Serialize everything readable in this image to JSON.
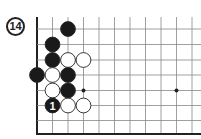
{
  "diagram": {
    "label": "14",
    "board": {
      "origin_x": 37,
      "spacing": 15.5,
      "row_y": [
        29,
        44.5,
        60,
        75,
        90.5,
        105.5,
        120.5
      ],
      "bottom_border_y": 134,
      "top_y": 17,
      "cols": 11,
      "left_edge": true,
      "bottom_edge": true
    },
    "star_points": [
      {
        "col": 3,
        "row": 4
      },
      {
        "col": 9,
        "row": 4
      }
    ],
    "stones": [
      {
        "color": "black",
        "col": 2,
        "row": 0
      },
      {
        "color": "black",
        "col": 1,
        "row": 1
      },
      {
        "color": "black",
        "col": 1,
        "row": 2
      },
      {
        "color": "white",
        "col": 2,
        "row": 2
      },
      {
        "color": "white",
        "col": 3,
        "row": 2
      },
      {
        "color": "black",
        "col": 0,
        "row": 3
      },
      {
        "color": "white",
        "col": 1,
        "row": 3
      },
      {
        "color": "black",
        "col": 2,
        "row": 3
      },
      {
        "color": "white",
        "col": 1,
        "row": 4
      },
      {
        "color": "black",
        "col": 2,
        "row": 4
      },
      {
        "color": "black",
        "col": 1,
        "row": 5,
        "number": "1"
      },
      {
        "color": "white",
        "col": 2,
        "row": 5
      },
      {
        "color": "white",
        "col": 3,
        "row": 5
      }
    ]
  }
}
